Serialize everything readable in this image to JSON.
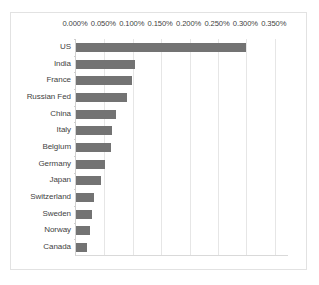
{
  "chart_data": {
    "type": "bar",
    "orientation": "horizontal",
    "title": "",
    "subtitle": "",
    "xlabel": "",
    "ylabel": "",
    "categories": [
      "US",
      "India",
      "France",
      "Russian Fed",
      "China",
      "Italy",
      "Belgium",
      "Germany",
      "Japan",
      "Switzerland",
      "Sweden",
      "Norway",
      "Canada"
    ],
    "values": [
      0.3,
      0.104,
      0.099,
      0.09,
      0.07,
      0.063,
      0.061,
      0.051,
      0.044,
      0.031,
      0.029,
      0.024,
      0.02
    ],
    "value_unit": "percent",
    "xlim": [
      0.0,
      0.375
    ],
    "xticks": [
      0.0,
      0.05,
      0.1,
      0.15,
      0.2,
      0.25,
      0.3,
      0.35
    ],
    "xtick_labels": [
      "0.000%",
      "0.050%",
      "0.100%",
      "0.150%",
      "0.200%",
      "0.250%",
      "0.300%",
      "0.350%"
    ],
    "grid": "vertical",
    "legend": null,
    "legend_position": "none",
    "series": [
      {
        "name": "",
        "values": [
          0.3,
          0.104,
          0.099,
          0.09,
          0.07,
          0.063,
          0.061,
          0.051,
          0.044,
          0.031,
          0.029,
          0.024,
          0.02
        ]
      }
    ]
  },
  "colors": {
    "bar": "#737373",
    "gridline": "#e6e6e6",
    "axis": "#d0d0d0",
    "frame": "#e2e2e2",
    "text": "#3f3f3f",
    "background": "#ffffff"
  }
}
